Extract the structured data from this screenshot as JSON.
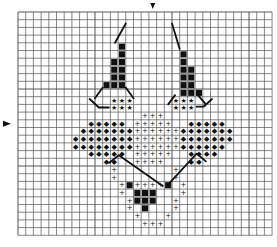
{
  "pattern": {
    "title": "",
    "grid": {
      "cols": 33,
      "rows": 29,
      "x0": 18,
      "y0": 12,
      "cell": 7.7,
      "line_color": "#555555",
      "bg": "#ffffff"
    },
    "center_markers": {
      "top_col": 17,
      "left_row": 14.5
    },
    "symbols": {
      "solid": {
        "glyph": "■",
        "color": "#111111"
      },
      "star": {
        "glyph": "★",
        "color": "#111111"
      },
      "cross": {
        "glyph": "+",
        "color": "#111111"
      },
      "diamond": {
        "glyph": "◆",
        "color": "#666666"
      }
    },
    "cells": {
      "solid": [
        [
          13,
          4
        ],
        [
          13,
          5
        ],
        [
          12,
          6
        ],
        [
          13,
          6
        ],
        [
          12,
          7
        ],
        [
          13,
          7
        ],
        [
          12,
          8
        ],
        [
          13,
          8
        ],
        [
          11,
          9
        ],
        [
          12,
          9
        ],
        [
          13,
          9
        ],
        [
          21,
          5
        ],
        [
          21,
          6
        ],
        [
          21,
          7
        ],
        [
          22,
          7
        ],
        [
          21,
          8
        ],
        [
          22,
          8
        ],
        [
          21,
          9
        ],
        [
          22,
          9
        ],
        [
          21,
          10
        ],
        [
          22,
          10
        ],
        [
          23,
          10
        ],
        [
          14,
          22
        ],
        [
          19,
          22
        ],
        [
          15,
          23
        ],
        [
          16,
          23
        ],
        [
          17,
          23
        ],
        [
          15,
          24
        ],
        [
          16,
          24
        ],
        [
          17,
          24
        ],
        [
          16,
          25
        ]
      ],
      "star": [
        [
          12,
          11
        ],
        [
          13,
          11
        ],
        [
          14,
          11
        ],
        [
          12,
          12
        ],
        [
          13,
          12
        ],
        [
          14,
          12
        ],
        [
          20,
          11
        ],
        [
          21,
          11
        ],
        [
          22,
          11
        ],
        [
          20,
          12
        ],
        [
          21,
          12
        ],
        [
          22,
          12
        ]
      ],
      "cross": [
        [
          16,
          13
        ],
        [
          17,
          13
        ],
        [
          18,
          13
        ],
        [
          15,
          14
        ],
        [
          16,
          14
        ],
        [
          17,
          14
        ],
        [
          18,
          14
        ],
        [
          19,
          14
        ],
        [
          14,
          15
        ],
        [
          15,
          15
        ],
        [
          16,
          15
        ],
        [
          17,
          15
        ],
        [
          18,
          15
        ],
        [
          19,
          15
        ],
        [
          20,
          15
        ],
        [
          14,
          16
        ],
        [
          15,
          16
        ],
        [
          16,
          16
        ],
        [
          17,
          16
        ],
        [
          18,
          16
        ],
        [
          19,
          16
        ],
        [
          20,
          16
        ],
        [
          14,
          17
        ],
        [
          15,
          17
        ],
        [
          16,
          17
        ],
        [
          17,
          17
        ],
        [
          18,
          17
        ],
        [
          19,
          17
        ],
        [
          20,
          17
        ],
        [
          15,
          18
        ],
        [
          16,
          18
        ],
        [
          17,
          18
        ],
        [
          18,
          18
        ],
        [
          19,
          18
        ],
        [
          15,
          19
        ],
        [
          16,
          19
        ],
        [
          17,
          19
        ],
        [
          18,
          19
        ],
        [
          12,
          20
        ],
        [
          20,
          20
        ],
        [
          12,
          21
        ],
        [
          20,
          21
        ],
        [
          13,
          22
        ],
        [
          15,
          22
        ],
        [
          16,
          22
        ],
        [
          17,
          22
        ],
        [
          18,
          22
        ],
        [
          21,
          22
        ],
        [
          13,
          23
        ],
        [
          21,
          23
        ],
        [
          14,
          24
        ],
        [
          20,
          24
        ],
        [
          14,
          25
        ],
        [
          20,
          25
        ],
        [
          15,
          26
        ],
        [
          19,
          26
        ],
        [
          16,
          27
        ],
        [
          17,
          27
        ],
        [
          18,
          27
        ]
      ],
      "diamond": [
        [
          9,
          14
        ],
        [
          10,
          14
        ],
        [
          11,
          14
        ],
        [
          12,
          14
        ],
        [
          13,
          14
        ],
        [
          8,
          15
        ],
        [
          9,
          15
        ],
        [
          10,
          15
        ],
        [
          11,
          15
        ],
        [
          12,
          15
        ],
        [
          13,
          15
        ],
        [
          14,
          15
        ],
        [
          7,
          16
        ],
        [
          8,
          16
        ],
        [
          9,
          16
        ],
        [
          10,
          16
        ],
        [
          11,
          16
        ],
        [
          12,
          16
        ],
        [
          13,
          16
        ],
        [
          14,
          16
        ],
        [
          7,
          17
        ],
        [
          8,
          17
        ],
        [
          9,
          17
        ],
        [
          10,
          17
        ],
        [
          11,
          17
        ],
        [
          12,
          17
        ],
        [
          13,
          17
        ],
        [
          14,
          17
        ],
        [
          9,
          18
        ],
        [
          10,
          18
        ],
        [
          11,
          18
        ],
        [
          12,
          18
        ],
        [
          13,
          18
        ],
        [
          11,
          19
        ],
        [
          12,
          19
        ],
        [
          22,
          14
        ],
        [
          23,
          14
        ],
        [
          24,
          14
        ],
        [
          25,
          14
        ],
        [
          26,
          14
        ],
        [
          21,
          15
        ],
        [
          22,
          15
        ],
        [
          23,
          15
        ],
        [
          24,
          15
        ],
        [
          25,
          15
        ],
        [
          26,
          15
        ],
        [
          27,
          15
        ],
        [
          21,
          16
        ],
        [
          22,
          16
        ],
        [
          23,
          16
        ],
        [
          24,
          16
        ],
        [
          25,
          16
        ],
        [
          26,
          16
        ],
        [
          27,
          16
        ],
        [
          21,
          17
        ],
        [
          22,
          17
        ],
        [
          23,
          17
        ],
        [
          24,
          17
        ],
        [
          25,
          17
        ],
        [
          26,
          17
        ],
        [
          22,
          18
        ],
        [
          23,
          18
        ],
        [
          24,
          18
        ],
        [
          25,
          18
        ],
        [
          22,
          19
        ],
        [
          23,
          19
        ]
      ]
    },
    "backstitch": [
      [
        [
          14,
          1.5
        ],
        [
          12.6,
          4
        ]
      ],
      [
        [
          11,
          9.8
        ],
        [
          10,
          11.2
        ]
      ],
      [
        [
          14,
          9.8
        ],
        [
          15,
          11.2
        ]
      ],
      [
        [
          9.3,
          11.3
        ],
        [
          10.5,
          12.4
        ],
        [
          11.8,
          12.4
        ]
      ],
      [
        [
          20,
          1.5
        ],
        [
          21,
          4.8
        ]
      ],
      [
        [
          20.4,
          10.8
        ],
        [
          19.5,
          12
        ]
      ],
      [
        [
          23.2,
          10.6
        ],
        [
          24.4,
          12
        ]
      ],
      [
        [
          23.2,
          12.3
        ],
        [
          24.1,
          12.3
        ],
        [
          25.2,
          11.3
        ]
      ],
      [
        [
          11.8,
          19.6
        ],
        [
          13.1,
          18.6
        ],
        [
          18.8,
          22.6
        ]
      ],
      [
        [
          19.3,
          22.6
        ],
        [
          23.2,
          18.4
        ],
        [
          24.4,
          19.4
        ]
      ]
    ]
  }
}
